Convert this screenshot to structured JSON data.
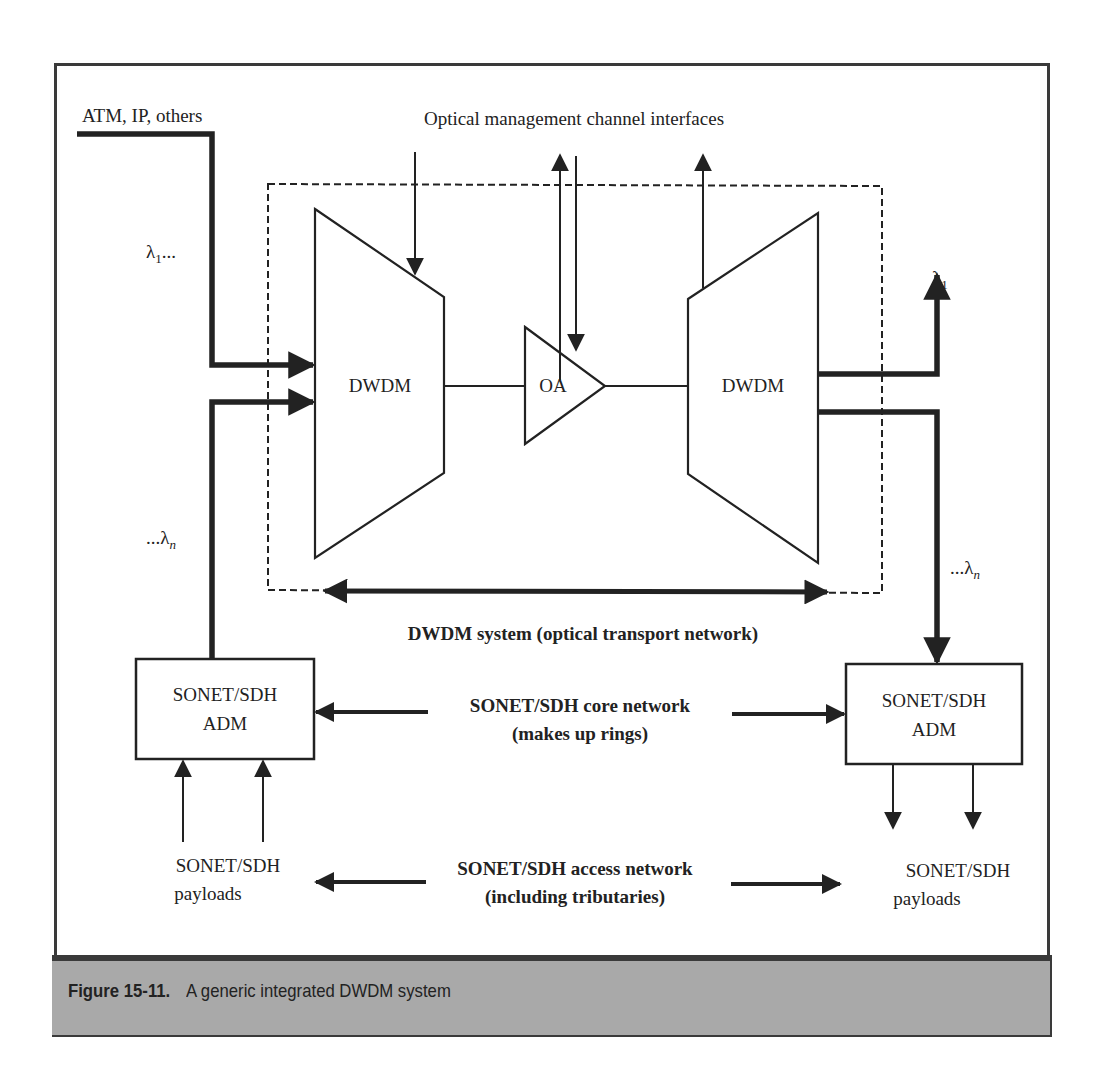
{
  "figure": {
    "number_label": "Figure 15-11.",
    "caption": "A generic integrated DWDM system"
  },
  "labels": {
    "input_traffic": "ATM, IP, others",
    "management_channels": "Optical management channel interfaces",
    "lambda_1_in": "λ1...",
    "lambda_n_in": "...λn",
    "lambda_1_out": "λ1",
    "lambda_n_out": "...λn",
    "dwdm_left": "DWDM",
    "optical_amplifier": "OA",
    "dwdm_right": "DWDM",
    "dwdm_system": "DWDM system (optical transport network)",
    "adm_left_line1": "SONET/SDH",
    "adm_left_line2": "ADM",
    "adm_right_line1": "SONET/SDH",
    "adm_right_line2": "ADM",
    "core_network_line1": "SONET/SDH core network",
    "core_network_line2": "(makes up rings)",
    "access_network_line1": "SONET/SDH access network",
    "access_network_line2": "(including tributaries)",
    "payloads_left_line1": "SONET/SDH",
    "payloads_left_line2": "payloads",
    "payloads_right_line1": "SONET/SDH",
    "payloads_right_line2": "payloads"
  },
  "lambda": {
    "symbol": "λ",
    "sub_1": "1",
    "sub_n": "n",
    "ellipsis": "..."
  },
  "colors": {
    "ink": "#222222",
    "caption_band": "#a9a9a9",
    "frame": "#3a3a3a"
  }
}
